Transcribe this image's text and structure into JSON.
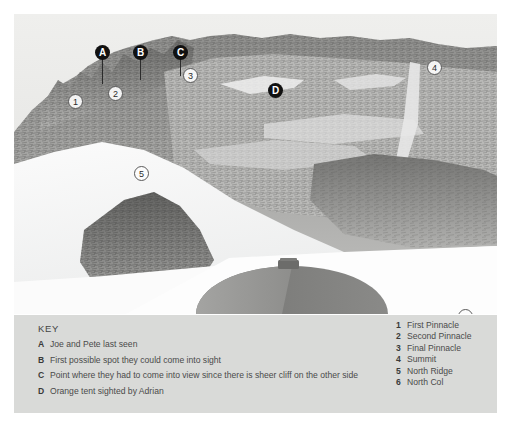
{
  "photo": {
    "subject": "annotated-mountain-ridge-photograph",
    "letter_markers": [
      {
        "id": "A",
        "x": 81,
        "y": 31,
        "leader_height": 26
      },
      {
        "id": "B",
        "x": 119,
        "y": 31,
        "leader_height": 22
      },
      {
        "id": "C",
        "x": 159,
        "y": 31,
        "leader_height": 18
      },
      {
        "id": "D",
        "x": 254,
        "y": 69,
        "leader_height": 0
      }
    ],
    "number_markers": [
      {
        "id": "1",
        "x": 54,
        "y": 80
      },
      {
        "id": "2",
        "x": 94,
        "y": 72
      },
      {
        "id": "3",
        "x": 169,
        "y": 54
      },
      {
        "id": "4",
        "x": 413,
        "y": 46
      },
      {
        "id": "5",
        "x": 120,
        "y": 152
      },
      {
        "id": "6",
        "x": 444,
        "y": 295
      }
    ]
  },
  "key": {
    "title": "KEY",
    "letters": [
      {
        "id": "A",
        "text": "Joe and Pete last seen"
      },
      {
        "id": "B",
        "text": "First possible spot they could come into sight"
      },
      {
        "id": "C",
        "text": "Point where they had to come into view since there is sheer cliff on the other side"
      },
      {
        "id": "D",
        "text": "Orange tent sighted by Adrian"
      }
    ],
    "numbers": [
      {
        "id": "1",
        "text": "First Pinnacle"
      },
      {
        "id": "2",
        "text": "Second Pinnacle"
      },
      {
        "id": "3",
        "text": "Final Pinnacle"
      },
      {
        "id": "4",
        "text": "Summit"
      },
      {
        "id": "5",
        "text": "North Ridge"
      },
      {
        "id": "6",
        "text": "North Col"
      }
    ]
  },
  "colors": {
    "key_panel_bg": "#d9dad8",
    "marker_dark": "#111111",
    "marker_light": "#fcfcfc",
    "page_bg": "#ffffff",
    "tent_light": "#9a9a9a",
    "tent_dark": "#6f6f6f"
  }
}
